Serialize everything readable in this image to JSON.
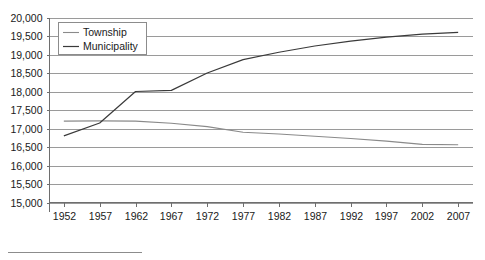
{
  "chart_data": {
    "type": "line",
    "title": "",
    "xlabel": "",
    "ylabel": "",
    "x": [
      1952,
      1957,
      1962,
      1967,
      1972,
      1977,
      1982,
      1987,
      1992,
      1997,
      2002,
      2007
    ],
    "xlim": [
      1950,
      2009
    ],
    "ylim": [
      15000,
      20000
    ],
    "grid": true,
    "legend_position": "top-left",
    "xtick_labels": [
      "1952",
      "1957",
      "1962",
      "1967",
      "1972",
      "1977",
      "1982",
      "1987",
      "1992",
      "1997",
      "2002",
      "2007"
    ],
    "ytick_labels": [
      "15,000",
      "15,500",
      "16,000",
      "16,500",
      "17,000",
      "17,500",
      "18,000",
      "18,500",
      "19,000",
      "19,500",
      "20,000"
    ],
    "ytick_values": [
      15000,
      15500,
      16000,
      16500,
      17000,
      17500,
      18000,
      18500,
      19000,
      19500,
      20000
    ],
    "series": [
      {
        "name": "Township",
        "color": "#8a8a8a",
        "width": 1.1,
        "values": [
          17200,
          17205,
          17200,
          17140,
          17050,
          16900,
          16850,
          16790,
          16730,
          16660,
          16570,
          16560
        ]
      },
      {
        "name": "Municipality",
        "color": "#3a3a3a",
        "width": 1.2,
        "values": [
          16800,
          17150,
          18000,
          18030,
          18500,
          18860,
          19060,
          19230,
          19360,
          19470,
          19550,
          19600
        ]
      }
    ]
  },
  "legend": {
    "entries": [
      {
        "label": "Township"
      },
      {
        "label": "Municipality"
      }
    ]
  },
  "colors": {
    "township": "#8a8a8a",
    "municipality": "#3a3a3a",
    "gridline": "#9a9a9a",
    "axis": "#6e6e6e",
    "text": "#1a1a1a",
    "background": "#ffffff"
  }
}
